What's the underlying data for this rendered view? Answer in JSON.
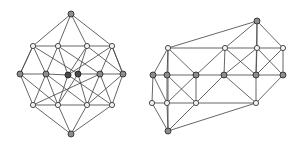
{
  "figure": {
    "background_color": "#ffffff",
    "width": 302,
    "height": 148,
    "edge_color": "#4a4a4a",
    "node_open_fill": "#f2f2f2",
    "node_grey_fill": "#8d8d8d",
    "node_dark_fill": "#4a4a4a",
    "node_stroke": "#2e2e2e"
  },
  "chart_data": {
    "type": "diagram",
    "subtitle": "",
    "xlabel": "",
    "ylabel": "",
    "graphs": [
      {
        "name": "left-graph",
        "label": "4-dimensional hypercube-like graph drawn as a rhombic projection",
        "node_count": 16,
        "nodes": [
          {
            "id": "L0",
            "x": 71,
            "y": 14,
            "style": "grey"
          },
          {
            "id": "L1",
            "x": 33,
            "y": 46,
            "style": "open"
          },
          {
            "id": "L2",
            "x": 58,
            "y": 46,
            "style": "open"
          },
          {
            "id": "L3",
            "x": 87,
            "y": 46,
            "style": "open"
          },
          {
            "id": "L4",
            "x": 112,
            "y": 46,
            "style": "open"
          },
          {
            "id": "L5",
            "x": 20,
            "y": 74,
            "style": "grey"
          },
          {
            "id": "L6",
            "x": 46,
            "y": 74,
            "style": "grey"
          },
          {
            "id": "L7",
            "x": 68,
            "y": 75,
            "style": "dark"
          },
          {
            "id": "L8",
            "x": 78,
            "y": 74,
            "style": "dark"
          },
          {
            "id": "L9",
            "x": 100,
            "y": 74,
            "style": "grey"
          },
          {
            "id": "L10",
            "x": 123,
            "y": 74,
            "style": "grey"
          },
          {
            "id": "L11",
            "x": 33,
            "y": 105,
            "style": "open"
          },
          {
            "id": "L12",
            "x": 58,
            "y": 105,
            "style": "open"
          },
          {
            "id": "L13",
            "x": 87,
            "y": 105,
            "style": "open"
          },
          {
            "id": "L14",
            "x": 112,
            "y": 105,
            "style": "open"
          },
          {
            "id": "L15",
            "x": 71,
            "y": 134,
            "style": "grey"
          }
        ],
        "edges": [
          [
            "L0",
            "L1"
          ],
          [
            "L0",
            "L2"
          ],
          [
            "L0",
            "L3"
          ],
          [
            "L0",
            "L4"
          ],
          [
            "L1",
            "L5"
          ],
          [
            "L1",
            "L6"
          ],
          [
            "L1",
            "L8"
          ],
          [
            "L2",
            "L6"
          ],
          [
            "L2",
            "L7"
          ],
          [
            "L2",
            "L9"
          ],
          [
            "L3",
            "L7"
          ],
          [
            "L3",
            "L8"
          ],
          [
            "L3",
            "L10"
          ],
          [
            "L4",
            "L9"
          ],
          [
            "L4",
            "L10"
          ],
          [
            "L4",
            "L7"
          ],
          [
            "L5",
            "L11"
          ],
          [
            "L5",
            "L12"
          ],
          [
            "L6",
            "L11"
          ],
          [
            "L6",
            "L13"
          ],
          [
            "L7",
            "L12"
          ],
          [
            "L7",
            "L14"
          ],
          [
            "L8",
            "L12"
          ],
          [
            "L8",
            "L13"
          ],
          [
            "L9",
            "L13"
          ],
          [
            "L9",
            "L11"
          ],
          [
            "L10",
            "L14"
          ],
          [
            "L10",
            "L13"
          ],
          [
            "L11",
            "L15"
          ],
          [
            "L12",
            "L15"
          ],
          [
            "L13",
            "L15"
          ],
          [
            "L14",
            "L15"
          ],
          [
            "L5",
            "L6"
          ],
          [
            "L9",
            "L10"
          ],
          [
            "L1",
            "L2"
          ],
          [
            "L3",
            "L4"
          ],
          [
            "L11",
            "L12"
          ],
          [
            "L13",
            "L14"
          ],
          [
            "L2",
            "L3"
          ],
          [
            "L12",
            "L13"
          ],
          [
            "L6",
            "L7"
          ],
          [
            "L8",
            "L9"
          ],
          [
            "L5",
            "L1"
          ],
          [
            "L10",
            "L4"
          ],
          [
            "L14",
            "L9"
          ],
          [
            "L6",
            "L12"
          ]
        ]
      },
      {
        "name": "right-graph",
        "label": "Prism-like graph drawn as an elongated box projection",
        "node_count": 16,
        "nodes": [
          {
            "id": "R0",
            "x": 257,
            "y": 21,
            "style": "grey"
          },
          {
            "id": "R1",
            "x": 168,
            "y": 48,
            "style": "open"
          },
          {
            "id": "R2",
            "x": 225,
            "y": 48,
            "style": "open"
          },
          {
            "id": "R3",
            "x": 257,
            "y": 48,
            "style": "open"
          },
          {
            "id": "R4",
            "x": 283,
            "y": 48,
            "style": "open"
          },
          {
            "id": "R5",
            "x": 153,
            "y": 75,
            "style": "grey"
          },
          {
            "id": "R6",
            "x": 167,
            "y": 75,
            "style": "grey"
          },
          {
            "id": "R7",
            "x": 196,
            "y": 75,
            "style": "grey"
          },
          {
            "id": "R8",
            "x": 224,
            "y": 75,
            "style": "grey"
          },
          {
            "id": "R9",
            "x": 256,
            "y": 75,
            "style": "grey"
          },
          {
            "id": "R10",
            "x": 283,
            "y": 75,
            "style": "grey"
          },
          {
            "id": "R11",
            "x": 152,
            "y": 103,
            "style": "open"
          },
          {
            "id": "R12",
            "x": 167,
            "y": 103,
            "style": "open"
          },
          {
            "id": "R13",
            "x": 196,
            "y": 103,
            "style": "open"
          },
          {
            "id": "R14",
            "x": 256,
            "y": 103,
            "style": "open"
          },
          {
            "id": "R15",
            "x": 168,
            "y": 131,
            "style": "grey"
          }
        ],
        "edges": [
          [
            "R0",
            "R2"
          ],
          [
            "R0",
            "R3"
          ],
          [
            "R0",
            "R4"
          ],
          [
            "R0",
            "R1"
          ],
          [
            "R1",
            "R6"
          ],
          [
            "R1",
            "R5"
          ],
          [
            "R1",
            "R7"
          ],
          [
            "R1",
            "R2"
          ],
          [
            "R2",
            "R7"
          ],
          [
            "R2",
            "R8"
          ],
          [
            "R2",
            "R9"
          ],
          [
            "R2",
            "R3"
          ],
          [
            "R3",
            "R8"
          ],
          [
            "R3",
            "R9"
          ],
          [
            "R3",
            "R10"
          ],
          [
            "R3",
            "R4"
          ],
          [
            "R4",
            "R9"
          ],
          [
            "R4",
            "R10"
          ],
          [
            "R5",
            "R11"
          ],
          [
            "R5",
            "R6"
          ],
          [
            "R6",
            "R12"
          ],
          [
            "R6",
            "R13"
          ],
          [
            "R6",
            "R7"
          ],
          [
            "R7",
            "R12"
          ],
          [
            "R7",
            "R13"
          ],
          [
            "R7",
            "R8"
          ],
          [
            "R8",
            "R13"
          ],
          [
            "R8",
            "R14"
          ],
          [
            "R8",
            "R9"
          ],
          [
            "R9",
            "R14"
          ],
          [
            "R9",
            "R10"
          ],
          [
            "R10",
            "R14"
          ],
          [
            "R11",
            "R12"
          ],
          [
            "R11",
            "R15"
          ],
          [
            "R12",
            "R15"
          ],
          [
            "R12",
            "R13"
          ],
          [
            "R13",
            "R15"
          ],
          [
            "R13",
            "R14"
          ],
          [
            "R14",
            "R15"
          ],
          [
            "R0",
            "R9"
          ],
          [
            "R1",
            "R15"
          ],
          [
            "R5",
            "R12"
          ]
        ]
      }
    ]
  }
}
